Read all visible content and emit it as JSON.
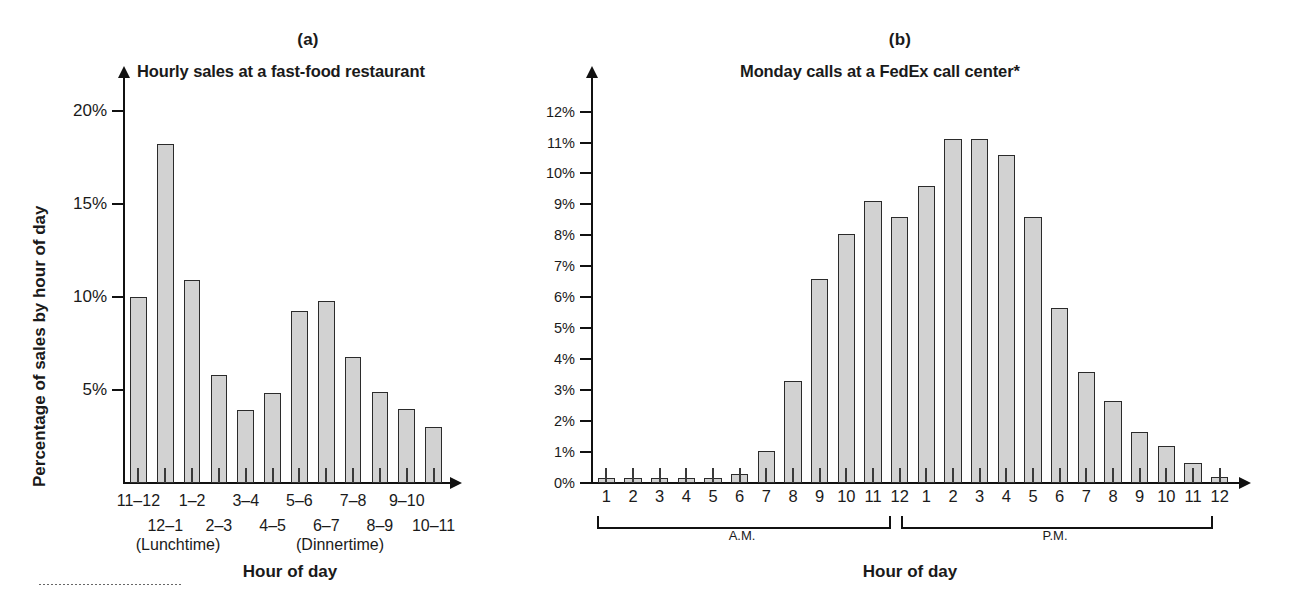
{
  "figure": {
    "panels": [
      {
        "letter": "(a)",
        "title": "Hourly sales at a fast-food restaurant",
        "ylabel": "Percentage of sales by hour of day",
        "xlabel": "Hour of day",
        "yticks": [
          "5%",
          "10%",
          "15%",
          "20%"
        ],
        "annotations": [
          "(Lunchtime)",
          "(Dinnertime)"
        ]
      },
      {
        "letter": "(b)",
        "title": "Monday calls at a FedEx call center*",
        "ylabel": "",
        "xlabel": "Hour of day",
        "yticks": [
          "0%",
          "1%",
          "2%",
          "3%",
          "4%",
          "5%",
          "6%",
          "7%",
          "8%",
          "9%",
          "10%",
          "11%",
          "12%"
        ],
        "brackets": [
          {
            "label": "A.M."
          },
          {
            "label": "P.M."
          }
        ]
      }
    ],
    "colors": {
      "bar_fill": "#d2d2d2",
      "bar_stroke": "#2b2b2b",
      "axis": "#111111",
      "text": "#1a1a1a"
    }
  },
  "chart_data": [
    {
      "type": "bar",
      "title": "Hourly sales at a fast-food restaurant",
      "panel": "(a)",
      "xlabel": "Hour of day",
      "ylabel": "Percentage of sales by hour of day",
      "categories": [
        "11–12",
        "12–1",
        "1–2",
        "2–3",
        "3–4",
        "4–5",
        "5–6",
        "6–7",
        "7–8",
        "8–9",
        "9–10",
        "10–11"
      ],
      "values": [
        10.0,
        18.2,
        10.9,
        5.8,
        3.9,
        4.85,
        9.25,
        9.8,
        6.8,
        4.9,
        4.0,
        3.0
      ],
      "ylim": [
        0,
        21.5
      ],
      "yticks": [
        5,
        10,
        15,
        20
      ],
      "ytick_labels": [
        "5%",
        "10%",
        "15%",
        "20%"
      ],
      "grid": false,
      "legend": "none",
      "annotations": [
        {
          "text": "(Lunchtime)",
          "near_category": "12–1"
        },
        {
          "text": "(Dinnertime)",
          "near_category": "6–7"
        }
      ]
    },
    {
      "type": "bar",
      "title": "Monday calls at a FedEx call center*",
      "panel": "(b)",
      "xlabel": "Hour of day",
      "ylabel": "",
      "categories": [
        "1",
        "2",
        "3",
        "4",
        "5",
        "6",
        "7",
        "8",
        "9",
        "10",
        "11",
        "12",
        "1",
        "2",
        "3",
        "4",
        "5",
        "6",
        "7",
        "8",
        "9",
        "10",
        "11",
        "12"
      ],
      "values": [
        0.15,
        0.15,
        0.15,
        0.15,
        0.15,
        0.3,
        1.05,
        3.3,
        6.6,
        8.05,
        9.1,
        8.6,
        9.6,
        11.1,
        11.1,
        10.6,
        8.6,
        5.65,
        3.6,
        2.65,
        1.65,
        1.2,
        0.65,
        0.2
      ],
      "ylim": [
        0,
        12.6
      ],
      "yticks": [
        0,
        1,
        2,
        3,
        4,
        5,
        6,
        7,
        8,
        9,
        10,
        11,
        12
      ],
      "ytick_labels": [
        "0%",
        "1%",
        "2%",
        "3%",
        "4%",
        "5%",
        "6%",
        "7%",
        "8%",
        "9%",
        "10%",
        "11%",
        "12%"
      ],
      "grid": false,
      "legend": "none",
      "groups": [
        {
          "label": "A.M.",
          "categories": [
            "1",
            "2",
            "3",
            "4",
            "5",
            "6",
            "7",
            "8",
            "9",
            "10",
            "11",
            "12"
          ]
        },
        {
          "label": "P.M.",
          "categories": [
            "1",
            "2",
            "3",
            "4",
            "5",
            "6",
            "7",
            "8",
            "9",
            "10",
            "11",
            "12"
          ]
        }
      ]
    }
  ]
}
